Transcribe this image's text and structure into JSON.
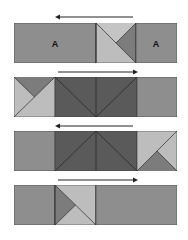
{
  "colors": {
    "medium": "#8e8e8e",
    "dark": "#5a5a5a",
    "light": "#bdbdbd",
    "mid_tri": "#7c7c7c",
    "border": "#3a3a3a",
    "arrow": "#222222"
  },
  "rows": [
    {
      "arrow_direction": "left",
      "labels": [
        "A",
        "A"
      ]
    },
    {
      "arrow_direction": "right"
    },
    {
      "arrow_direction": "left"
    },
    {
      "arrow_direction": "right"
    }
  ]
}
